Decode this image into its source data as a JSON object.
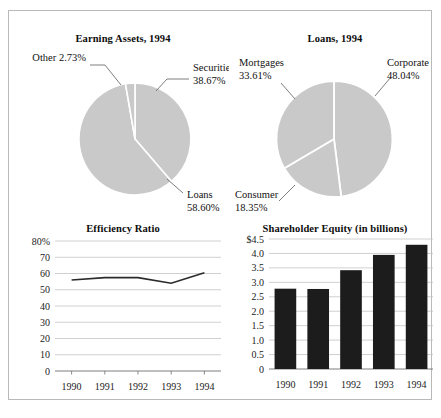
{
  "figure": {
    "background": "#ffffff",
    "border_color": "#b9b9b9",
    "pie_fill": "#c9c9c9",
    "pie_edge": "#ffffff",
    "bar_fill": "#1c1c1c",
    "line_color": "#2b2b2b",
    "grid_color": "#c4c4c4"
  },
  "chart_data": [
    {
      "type": "pie",
      "title": "Earning Assets, 1994",
      "labels": [
        "Securities",
        "Loans",
        "Other"
      ],
      "values": [
        38.67,
        58.6,
        2.73
      ],
      "value_labels": [
        "38.67%",
        "58.60%",
        "2.73%"
      ],
      "annotations": [
        {
          "name": "securities",
          "label": "Securities",
          "value": "38.67%"
        },
        {
          "name": "loans",
          "label": "Loans",
          "value": "58.60%"
        },
        {
          "name": "other",
          "label": "Other 2.73%",
          "value": "2.73%"
        }
      ],
      "legend": "none",
      "units": "percent"
    },
    {
      "type": "pie",
      "title": "Loans, 1994",
      "labels": [
        "Corporate",
        "Mortgages",
        "Consumer"
      ],
      "values": [
        48.04,
        33.61,
        18.35
      ],
      "value_labels": [
        "48.04%",
        "33.61%",
        "18.35%"
      ],
      "annotations": [
        {
          "name": "corporate",
          "label": "Corporate",
          "value": "48.04%"
        },
        {
          "name": "mortgages",
          "label": "Mortgages",
          "value": "33.61%"
        },
        {
          "name": "consumer",
          "label": "Consumer",
          "value": "18.35%"
        }
      ],
      "legend": "none",
      "units": "percent"
    },
    {
      "type": "line",
      "title": "Efficiency Ratio",
      "categories": [
        "1990",
        "1991",
        "1992",
        "1993",
        "1994"
      ],
      "x": [
        1990,
        1991,
        1992,
        1993,
        1994
      ],
      "values": [
        56.0,
        57.5,
        57.5,
        54.0,
        60.5
      ],
      "xlabel": "",
      "ylabel": "",
      "ylim": [
        0,
        80
      ],
      "yticks": [
        0,
        10,
        20,
        30,
        40,
        50,
        60,
        70,
        80
      ],
      "ytick_labels": [
        "0",
        "10",
        "20",
        "30",
        "40",
        "50",
        "60",
        "70",
        "80%"
      ],
      "grid": true,
      "units": "percent"
    },
    {
      "type": "bar",
      "title": "Shareholder Equity (in billions)",
      "categories": [
        "1990",
        "1991",
        "1992",
        "1993",
        "1994"
      ],
      "values": [
        2.78,
        2.77,
        3.42,
        3.95,
        4.3
      ],
      "xlabel": "",
      "ylabel": "",
      "ylim": [
        0,
        4.5
      ],
      "yticks": [
        0,
        0.5,
        1.0,
        1.5,
        2.0,
        2.5,
        3.0,
        3.5,
        4.0,
        4.5
      ],
      "ytick_labels": [
        "0",
        "0.5",
        "1.0",
        "1.5",
        "2.0",
        "2.5",
        "3.0",
        "3.5",
        "4.0",
        "$4.5"
      ],
      "grid": true,
      "units": "billions of dollars"
    }
  ]
}
